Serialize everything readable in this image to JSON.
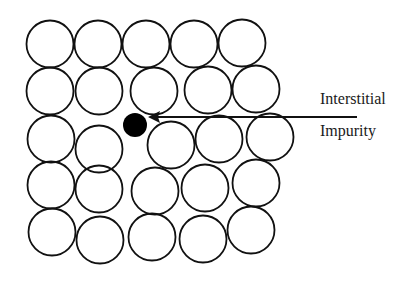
{
  "diagram": {
    "type": "crystal-lattice-defect",
    "atom_radius": 23.5,
    "atoms": [
      {
        "x": 50,
        "y": 44
      },
      {
        "x": 98,
        "y": 44
      },
      {
        "x": 146,
        "y": 44
      },
      {
        "x": 194,
        "y": 44
      },
      {
        "x": 242,
        "y": 43
      },
      {
        "x": 50,
        "y": 91
      },
      {
        "x": 99,
        "y": 91
      },
      {
        "x": 154,
        "y": 91
      },
      {
        "x": 208,
        "y": 90
      },
      {
        "x": 256,
        "y": 89
      },
      {
        "x": 51,
        "y": 139
      },
      {
        "x": 99,
        "y": 149
      },
      {
        "x": 171,
        "y": 145
      },
      {
        "x": 219,
        "y": 139
      },
      {
        "x": 270,
        "y": 137
      },
      {
        "x": 51,
        "y": 185
      },
      {
        "x": 99,
        "y": 189
      },
      {
        "x": 155,
        "y": 191
      },
      {
        "x": 205,
        "y": 188
      },
      {
        "x": 256,
        "y": 183
      },
      {
        "x": 52,
        "y": 232
      },
      {
        "x": 100,
        "y": 240
      },
      {
        "x": 152,
        "y": 237
      },
      {
        "x": 203,
        "y": 239
      },
      {
        "x": 251,
        "y": 230
      }
    ],
    "impurity": {
      "x": 135,
      "y": 125,
      "r": 12
    },
    "arrow": {
      "x1": 357,
      "y1": 117,
      "x2": 148,
      "y2": 117
    },
    "label_line1": "Interstitial",
    "label_line2": "Impurity",
    "stroke_color": "#111111"
  }
}
